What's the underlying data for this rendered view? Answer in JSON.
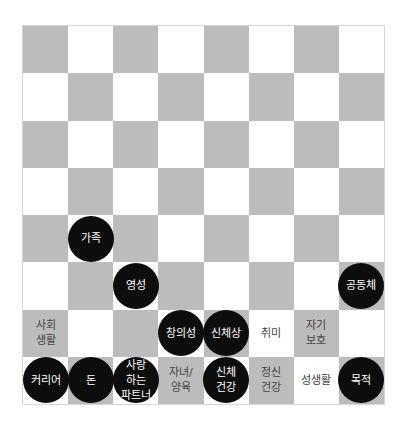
{
  "board": {
    "rows": 8,
    "cols": 8,
    "colors": {
      "gray": "#bcbcbc",
      "white": "#ffffff",
      "piece": "#0d0d0d"
    },
    "pieces": [
      {
        "row": 4,
        "col": 1,
        "label": "가족",
        "black": true
      },
      {
        "row": 5,
        "col": 2,
        "label": "영성",
        "black": true
      },
      {
        "row": 5,
        "col": 7,
        "label": "공동체",
        "black": true
      },
      {
        "row": 6,
        "col": 0,
        "label": "사회\n생활",
        "black": false
      },
      {
        "row": 6,
        "col": 3,
        "label": "창의성",
        "black": true
      },
      {
        "row": 6,
        "col": 4,
        "label": "신체상",
        "black": true
      },
      {
        "row": 6,
        "col": 5,
        "label": "취미",
        "black": false
      },
      {
        "row": 6,
        "col": 6,
        "label": "자기\n보호",
        "black": false
      },
      {
        "row": 7,
        "col": 0,
        "label": "커리어",
        "black": true
      },
      {
        "row": 7,
        "col": 1,
        "label": "돈",
        "black": true
      },
      {
        "row": 7,
        "col": 2,
        "label": "사랑\n하는\n파트너",
        "black": true
      },
      {
        "row": 7,
        "col": 3,
        "label": "자녀/\n양육",
        "black": false
      },
      {
        "row": 7,
        "col": 4,
        "label": "신체\n건강",
        "black": true
      },
      {
        "row": 7,
        "col": 5,
        "label": "정신\n건강",
        "black": false
      },
      {
        "row": 7,
        "col": 6,
        "label": "성생활",
        "black": false
      },
      {
        "row": 7,
        "col": 7,
        "label": "목적",
        "black": true
      }
    ]
  }
}
